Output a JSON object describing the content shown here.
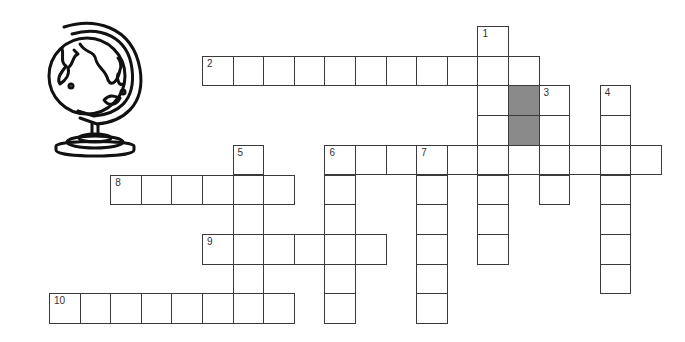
{
  "illustration": {
    "icon": "globe-icon",
    "description": "desk globe on stand"
  },
  "grid": {
    "origin_x": 49,
    "origin_y": 26,
    "cell_w": 30.6,
    "cell_h": 29.7,
    "colors": {
      "line": "#3a3a3a",
      "cell": "#ffffff",
      "blocked": "#8a8a8a"
    },
    "blocked_cells": [
      [
        15,
        2
      ],
      [
        15,
        3
      ]
    ]
  },
  "entries": [
    {
      "number": "1",
      "direction": "down",
      "col": 14,
      "row": 0,
      "length": 8
    },
    {
      "number": "2",
      "direction": "across",
      "col": 5,
      "row": 1,
      "length": 11
    },
    {
      "number": "3",
      "direction": "down",
      "col": 16,
      "row": 2,
      "length": 4
    },
    {
      "number": "4",
      "direction": "down",
      "col": 18,
      "row": 2,
      "length": 7
    },
    {
      "number": "5",
      "direction": "down",
      "col": 6,
      "row": 4,
      "length": 6
    },
    {
      "number": "6",
      "direction": "across",
      "col": 9,
      "row": 4,
      "length": 11
    },
    {
      "number": "6",
      "direction": "down",
      "col": 9,
      "row": 4,
      "length": 6
    },
    {
      "number": "7",
      "direction": "down",
      "col": 12,
      "row": 4,
      "length": 6
    },
    {
      "number": "8",
      "direction": "across",
      "col": 2,
      "row": 5,
      "length": 6
    },
    {
      "number": "9",
      "direction": "across",
      "col": 5,
      "row": 7,
      "length": 6
    },
    {
      "number": "10",
      "direction": "across",
      "col": 0,
      "row": 9,
      "length": 8
    }
  ]
}
